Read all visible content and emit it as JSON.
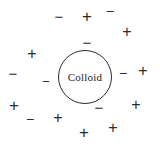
{
  "figure": {
    "background_color": "#ffffff",
    "stroke_color": "#2b2b2b",
    "width": 160,
    "height": 146
  },
  "particle": {
    "label": "Colloid",
    "shape": "circle",
    "center_x": 85,
    "center_y": 77,
    "diameter": 54,
    "border_color": "#2b2b2b",
    "border_width": 1,
    "fill": "none"
  },
  "charges": [
    {
      "id": "charge-1",
      "sign": "−",
      "type": "negative",
      "x": 59,
      "y": 16,
      "size": 15
    },
    {
      "id": "charge-2",
      "sign": "+",
      "type": "positive",
      "x": 87,
      "y": 16,
      "size": 17
    },
    {
      "id": "charge-3",
      "sign": "−",
      "type": "negative",
      "x": 110,
      "y": 11,
      "size": 14
    },
    {
      "id": "charge-4",
      "sign": "+",
      "type": "positive",
      "x": 127,
      "y": 32,
      "size": 16
    },
    {
      "id": "charge-5",
      "sign": "−",
      "type": "negative",
      "x": 87,
      "y": 42,
      "size": 15
    },
    {
      "id": "charge-6",
      "sign": "+",
      "type": "positive",
      "x": 32,
      "y": 54,
      "size": 16
    },
    {
      "id": "charge-7",
      "sign": "−",
      "type": "negative",
      "x": 13,
      "y": 73,
      "size": 15
    },
    {
      "id": "charge-8",
      "sign": "−",
      "type": "negative",
      "x": 46,
      "y": 81,
      "size": 13
    },
    {
      "id": "charge-9",
      "sign": "−",
      "type": "negative",
      "x": 123,
      "y": 73,
      "size": 14
    },
    {
      "id": "charge-10",
      "sign": "+",
      "type": "positive",
      "x": 143,
      "y": 71,
      "size": 16
    },
    {
      "id": "charge-11",
      "sign": "+",
      "type": "positive",
      "x": 14,
      "y": 105,
      "size": 17
    },
    {
      "id": "charge-12",
      "sign": "−",
      "type": "negative",
      "x": 30,
      "y": 119,
      "size": 14
    },
    {
      "id": "charge-13",
      "sign": "+",
      "type": "positive",
      "x": 58,
      "y": 118,
      "size": 16
    },
    {
      "id": "charge-14",
      "sign": "−",
      "type": "negative",
      "x": 99,
      "y": 107,
      "size": 15
    },
    {
      "id": "charge-15",
      "sign": "+",
      "type": "positive",
      "x": 136,
      "y": 105,
      "size": 16
    },
    {
      "id": "charge-16",
      "sign": "+",
      "type": "positive",
      "x": 84,
      "y": 132,
      "size": 17
    },
    {
      "id": "charge-17",
      "sign": "+",
      "type": "positive",
      "x": 113,
      "y": 128,
      "size": 16
    }
  ]
}
